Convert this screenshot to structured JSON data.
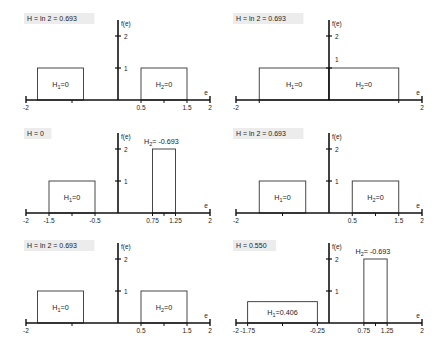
{
  "chart_data": [
    {
      "type": "bar",
      "panel": "top-left",
      "title": "H = ln 2 = 0.693",
      "xlabel": "e",
      "ylabel": "f(e)",
      "xlim": [
        -2,
        2
      ],
      "ylim": [
        0,
        2
      ],
      "x_tick_labels": [
        "-2",
        "0.5",
        "1.5",
        "2"
      ],
      "x_tick_marks": [
        -2,
        -1,
        0.5,
        1,
        1.5,
        2
      ],
      "y_ticks": [
        1,
        2
      ],
      "bars": [
        {
          "x0": -1.75,
          "x1": -0.75,
          "height": 1,
          "label": "H",
          "sub": "1",
          "value": "=0"
        },
        {
          "x0": 0.5,
          "x1": 1.5,
          "height": 1,
          "label": "H",
          "sub": "2",
          "value": "=0"
        }
      ]
    },
    {
      "type": "bar",
      "panel": "top-right",
      "title": "H = ln 2 = 0.693",
      "xlabel": "e",
      "ylabel": "f(e)",
      "xlim": [
        -2,
        2
      ],
      "ylim": [
        0,
        2
      ],
      "x_tick_labels": [
        "-2",
        "2"
      ],
      "x_tick_marks": [
        -2,
        -1.5,
        1.5,
        2
      ],
      "y_ticks": [
        1,
        2
      ],
      "y_tick_label_offset_1": true,
      "bars": [
        {
          "x0": -1.5,
          "x1": 0,
          "height": 1,
          "label": "H",
          "sub": "1",
          "value": "=0"
        },
        {
          "x0": 0,
          "x1": 1.5,
          "height": 1,
          "label": "H",
          "sub": "2",
          "value": "=0"
        }
      ]
    },
    {
      "type": "bar",
      "panel": "middle-left",
      "title": "H = 0",
      "xlabel": "e",
      "ylabel": "f(e)",
      "xlim": [
        -2,
        2
      ],
      "ylim": [
        0,
        2
      ],
      "x_tick_labels": [
        "-2",
        "-1.5",
        "-0.5",
        "0.75",
        "1.25",
        "2"
      ],
      "x_tick_marks": [
        -2,
        -1.5,
        -1,
        -0.5,
        0.75,
        1,
        1.25,
        2
      ],
      "y_ticks": [
        1,
        2
      ],
      "bars": [
        {
          "x0": -1.5,
          "x1": -0.5,
          "height": 1,
          "label": "H",
          "sub": "1",
          "value": "=0"
        },
        {
          "x0": 0.75,
          "x1": 1.25,
          "height": 2,
          "label": "H",
          "sub": "2",
          "value": "= -0.693",
          "label_above": true
        }
      ]
    },
    {
      "type": "bar",
      "panel": "middle-right",
      "title": "H = ln 2 = 0.693",
      "xlabel": "e",
      "ylabel": "f(e)",
      "xlim": [
        -2,
        2
      ],
      "ylim": [
        0,
        2
      ],
      "x_tick_labels": [
        "-2",
        "0.5",
        "1.5",
        "2"
      ],
      "x_tick_marks": [
        -2,
        -1,
        0.5,
        1,
        1.5,
        2
      ],
      "y_ticks": [
        1,
        2
      ],
      "bars": [
        {
          "x0": -1.5,
          "x1": -0.5,
          "height": 1,
          "label": "H",
          "sub": "1",
          "value": "=0"
        },
        {
          "x0": 0.5,
          "x1": 1.5,
          "height": 1,
          "label": "H",
          "sub": "2",
          "value": "=0"
        }
      ]
    },
    {
      "type": "bar",
      "panel": "bottom-left",
      "title": "H = ln 2 = 0.693",
      "xlabel": "e",
      "ylabel": "f(e)",
      "xlim": [
        -2,
        2
      ],
      "ylim": [
        0,
        2
      ],
      "x_tick_labels": [
        "-2",
        "0.5",
        "1.5",
        "2"
      ],
      "x_tick_marks": [
        -2,
        -1,
        0.5,
        1,
        1.5,
        2
      ],
      "y_ticks": [
        1,
        2
      ],
      "bars": [
        {
          "x0": -1.75,
          "x1": -0.75,
          "height": 1,
          "label": "H",
          "sub": "1",
          "value": "=0"
        },
        {
          "x0": 0.5,
          "x1": 1.5,
          "height": 1,
          "label": "H",
          "sub": "2",
          "value": "=0"
        }
      ]
    },
    {
      "type": "bar",
      "panel": "bottom-right",
      "title": "H = 0.550",
      "xlabel": "e",
      "ylabel": "f(e)",
      "xlim": [
        -2,
        2
      ],
      "ylim": [
        0,
        2
      ],
      "x_tick_labels": [
        "-2",
        "-1.75",
        "-0.25",
        "0.75",
        "1.25",
        "2"
      ],
      "x_tick_marks": [
        -2,
        -1.75,
        -1,
        -0.25,
        0.75,
        1,
        1.25,
        2
      ],
      "y_ticks": [
        1,
        2
      ],
      "bars": [
        {
          "x0": -1.75,
          "x1": -0.25,
          "height": 0.667,
          "label": "H",
          "sub": "1",
          "value": "=0.406"
        },
        {
          "x0": 0.75,
          "x1": 1.25,
          "height": 2,
          "label": "H",
          "sub": "2",
          "value": "= -0.693",
          "label_above": true
        }
      ]
    }
  ],
  "layout": {
    "panels": [
      {
        "ox": 118,
        "oy": 100,
        "sx": 46,
        "sy": 32,
        "title_x": 27,
        "title_y": 21
      },
      {
        "ox": 329,
        "oy": 100,
        "sx": 46.5,
        "sy": 32,
        "title_x": 236,
        "title_y": 21
      },
      {
        "ox": 118,
        "oy": 213,
        "sx": 46,
        "sy": 32,
        "title_x": 27,
        "title_y": 136
      },
      {
        "ox": 329,
        "oy": 213,
        "sx": 46.5,
        "sy": 32,
        "title_x": 236,
        "title_y": 136
      },
      {
        "ox": 118,
        "oy": 323,
        "sx": 46,
        "sy": 32,
        "title_x": 27,
        "title_y": 248
      },
      {
        "ox": 329,
        "oy": 323,
        "sx": 46.5,
        "sy": 32,
        "title_x": 236,
        "title_y": 248
      }
    ],
    "colors": {
      "axis": "#111111",
      "box": "#333333",
      "title_bg": "#ececec",
      "text": "#222222"
    }
  }
}
